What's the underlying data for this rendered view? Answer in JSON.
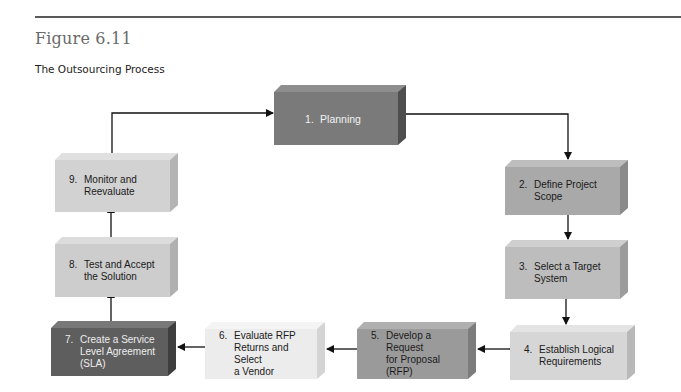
{
  "header": {
    "figure_number": "Figure 6.11",
    "figure_title": "The Outsourcing Process"
  },
  "steps": [
    {
      "num": "1.",
      "text": "Planning",
      "front": "#7a7a7a",
      "top": "#8e8e8e",
      "side": "#4e4e4e",
      "color": "#f2f2f2"
    },
    {
      "num": "2.",
      "text": "Define Project\nScope",
      "front": "#a9a9a9",
      "top": "#bdbdbd",
      "side": "#8a8a8a",
      "color": "#1a1a1a"
    },
    {
      "num": "3.",
      "text": "Select a Target\nSystem",
      "front": "#bdbdbd",
      "top": "#cfcfcf",
      "side": "#9c9c9c",
      "color": "#1a1a1a"
    },
    {
      "num": "4.",
      "text": "Establish Logical\nRequirements",
      "front": "#d6d6d6",
      "top": "#e4e4e4",
      "side": "#b8b8b8",
      "color": "#1a1a1a"
    },
    {
      "num": "5.",
      "text": "Develop a Request\nfor Proposal (RFP)",
      "front": "#9a9a9a",
      "top": "#b0b0b0",
      "side": "#7c7c7c",
      "color": "#1a1a1a"
    },
    {
      "num": "6.",
      "text": "Evaluate RFP\nReturns and Select\na Vendor",
      "front": "#ececec",
      "top": "#f4f4f4",
      "side": "#d4d4d4",
      "color": "#1a1a1a"
    },
    {
      "num": "7.",
      "text": "Create a Service\nLevel Agreement\n(SLA)",
      "front": "#5e5e5e",
      "top": "#787878",
      "side": "#3e3e3e",
      "color": "#eeeeee"
    },
    {
      "num": "8.",
      "text": "Test and Accept\nthe Solution",
      "front": "#cdcdcd",
      "top": "#dcdcdc",
      "side": "#b0b0b0",
      "color": "#1a1a1a"
    },
    {
      "num": "9.",
      "text": "Monitor and\nReevaluate",
      "front": "#d2d2d2",
      "top": "#e0e0e0",
      "side": "#b4b4b4",
      "color": "#1a1a1a"
    }
  ],
  "flow": [
    {
      "from": "1",
      "to": "2"
    },
    {
      "from": "2",
      "to": "3"
    },
    {
      "from": "3",
      "to": "4"
    },
    {
      "from": "4",
      "to": "5"
    },
    {
      "from": "5",
      "to": "6"
    },
    {
      "from": "6",
      "to": "7"
    },
    {
      "from": "7",
      "to": "8"
    },
    {
      "from": "8",
      "to": "9"
    },
    {
      "from": "9",
      "to": "1"
    }
  ],
  "colors": {
    "arrow": "#111111",
    "rule": "#5a5a5a"
  }
}
